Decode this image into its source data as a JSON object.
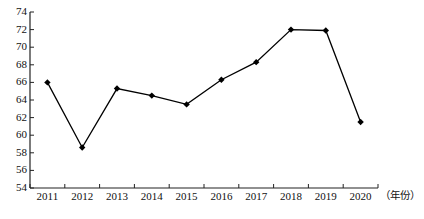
{
  "chart_data": {
    "type": "line",
    "title": "",
    "subtitle": "",
    "xlabel": "（年份）",
    "ylabel": "",
    "categories": [
      "2011",
      "2012",
      "2013",
      "2014",
      "2015",
      "2016",
      "2017",
      "2018",
      "2019",
      "2020"
    ],
    "values": [
      66.0,
      58.6,
      65.3,
      64.5,
      63.5,
      66.3,
      68.3,
      72.0,
      71.9,
      61.5
    ],
    "series": [
      {
        "name": "",
        "values": [
          66.0,
          58.6,
          65.3,
          64.5,
          63.5,
          66.3,
          68.3,
          72.0,
          71.9,
          61.5
        ]
      }
    ],
    "ylim": [
      54,
      74
    ],
    "ytick_step": 2,
    "yticks": [
      54,
      56,
      58,
      60,
      62,
      64,
      66,
      68,
      70,
      72,
      74
    ],
    "ytick_labels": [
      "54",
      "56",
      "58",
      "60",
      "62",
      "64",
      "66",
      "68",
      "70",
      "72",
      "74"
    ],
    "xticks": [
      "2011",
      "2012",
      "2013",
      "2014",
      "2015",
      "2016",
      "2017",
      "2018",
      "2019",
      "2020"
    ],
    "grid": false,
    "legend": false,
    "legend_position": "none",
    "marker": "diamond",
    "line_color": "#000000",
    "marker_color": "#000000",
    "annotations": []
  },
  "axes": {
    "x_axis_title": "（年份）"
  }
}
